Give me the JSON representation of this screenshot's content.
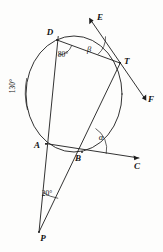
{
  "figure": {
    "background_color": "#fdfdfc",
    "ink_color": "#1c1c1c"
  },
  "points": {
    "D": {
      "label": "D",
      "x": 57,
      "y": 40,
      "label_x": 50,
      "label_y": 35
    },
    "T": {
      "label": "T",
      "x": 120,
      "y": 63,
      "label_x": 124,
      "label_y": 64
    },
    "A": {
      "label": "A",
      "x": 46,
      "y": 144,
      "label_x": 37,
      "label_y": 148
    },
    "B": {
      "label": "B",
      "x": 82,
      "y": 152,
      "label_x": 78,
      "label_y": 161
    },
    "P": {
      "label": "P",
      "x": 39,
      "y": 232,
      "label_x": 43,
      "label_y": 240
    },
    "E": {
      "label": "E",
      "x": 91,
      "y": 18,
      "label_x": 97,
      "label_y": 19
    },
    "F": {
      "label": "F",
      "x": 145,
      "y": 100,
      "label_x": 148,
      "label_y": 101
    },
    "C": {
      "label": "C",
      "x": 140,
      "y": 158,
      "label_x": 137,
      "label_y": 168
    }
  },
  "circle": {
    "center_x": 74,
    "center_y": 94,
    "radius_x": 48,
    "radius_y": 58
  },
  "angles": [
    {
      "name": "angle-at-D",
      "label": "80°",
      "x": 63,
      "y": 54,
      "rotate": 0
    },
    {
      "name": "arc-DA-left",
      "label": "130°",
      "x": 15,
      "y": 86,
      "rotate": -90
    },
    {
      "name": "angle-at-T",
      "label": "β",
      "x": 89,
      "y": 49,
      "rotate": 0
    },
    {
      "name": "angle-at-B",
      "label": "α",
      "x": 101,
      "y": 137,
      "rotate": 0
    },
    {
      "name": "angle-at-P",
      "label": "20°",
      "x": 44,
      "y": 194,
      "rotate": 0
    }
  ],
  "segments": [
    {
      "name": "line-P-to-D",
      "from": "P",
      "to": "D"
    },
    {
      "name": "line-P-to-T",
      "from": "P",
      "to": "T"
    },
    {
      "name": "chord-D-to-T",
      "from": "D",
      "to": "T"
    },
    {
      "name": "chord-A-to-B",
      "from": "A",
      "to": "B"
    },
    {
      "name": "ray-B-to-C",
      "from": "B",
      "to": "C"
    },
    {
      "name": "tangent-E-to-F",
      "from": "E",
      "to": "F"
    }
  ]
}
